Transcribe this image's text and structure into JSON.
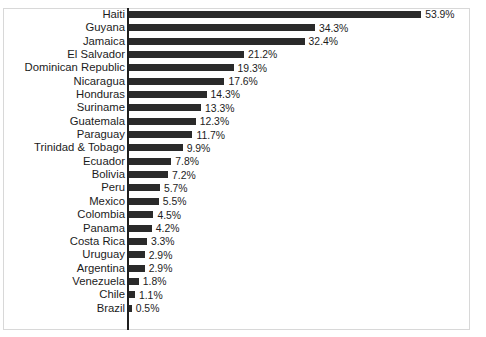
{
  "chart_data": {
    "type": "bar",
    "orientation": "horizontal",
    "title": "",
    "subtitle": "",
    "xlabel": "",
    "ylabel": "",
    "xlim": [
      0,
      53.9
    ],
    "grid": false,
    "legend": false,
    "value_suffix": "%",
    "categories": [
      "Haiti",
      "Guyana",
      "Jamaica",
      "El Salvador",
      "Dominican Republic",
      "Nicaragua",
      "Honduras",
      "Suriname",
      "Guatemala",
      "Paraguay",
      "Trinidad & Tobago",
      "Ecuador",
      "Bolivia",
      "Peru",
      "Mexico",
      "Colombia",
      "Panama",
      "Costa Rica",
      "Uruguay",
      "Argentina",
      "Venezuela",
      "Chile",
      "Brazil"
    ],
    "values": [
      53.9,
      34.3,
      32.4,
      21.2,
      19.3,
      17.6,
      14.3,
      13.3,
      12.3,
      11.7,
      9.9,
      7.8,
      7.2,
      5.7,
      5.5,
      4.5,
      4.2,
      3.3,
      2.9,
      2.9,
      1.8,
      1.1,
      0.5
    ],
    "data_labels": [
      "53.9%",
      "34.3%",
      "32.4%",
      "21.2%",
      "19.3%",
      "17.6%",
      "14.3%",
      "13.3%",
      "12.3%",
      "11.7%",
      "9.9%",
      "7.8%",
      "7.2%",
      "5.7%",
      "5.5%",
      "4.5%",
      "4.2%",
      "3.3%",
      "2.9%",
      "2.9%",
      "1.8%",
      "1.1%",
      "0.5%"
    ],
    "bar_color": "#2a2a2a",
    "background_color": "#ffffff",
    "axis_color": "#1f1f1f",
    "frame_color": "#d8d8d8"
  }
}
